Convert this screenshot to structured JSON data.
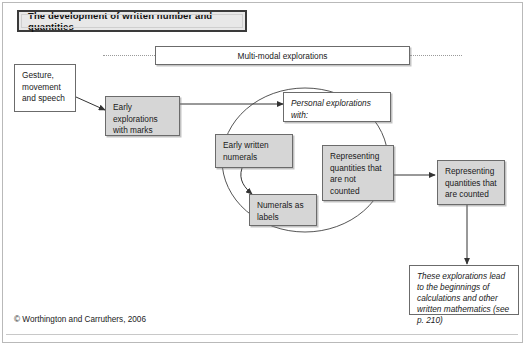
{
  "title": {
    "text": "The development of written number and quantities"
  },
  "banner": {
    "multi_modal_label": "Multi-modal explorations"
  },
  "nodes": {
    "gesture": "Gesture, movement and speech",
    "early_explorations": "Early explorations with marks",
    "personal_explorations": "Personal explorations with:",
    "early_written_numerals": "Early written numerals",
    "numerals_as_labels": "Numerals as labels",
    "not_counted": "Representing quantities that are not counted",
    "counted": "Representing quantities that are counted",
    "outcome": "These explorations lead to the beginnings of calculations and other written mathematics (see p. 210)"
  },
  "footer": {
    "copyright": "© Worthington and Carruthers, 2006"
  },
  "colors": {
    "node_fill": "#d6d6d6",
    "node_fill_white": "#ffffff",
    "node_border": "#6b6b6b",
    "title_fill": "#e8e8e8",
    "title_border": "#3a3a3a",
    "wire": "#333333",
    "dotted": "#9a9a9a",
    "page_border": "#b9b9b9"
  }
}
